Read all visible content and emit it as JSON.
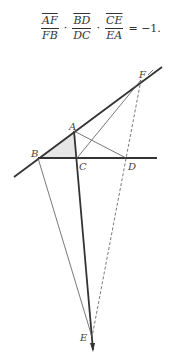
{
  "formula": {
    "fractions": [
      {
        "num": "AF",
        "den": "FB"
      },
      {
        "num": "BD",
        "den": "DC"
      },
      {
        "num": "CE",
        "den": "EA"
      }
    ],
    "operator": "·",
    "rhs": "= −1."
  },
  "figure": {
    "labels": {
      "A": "A",
      "B": "B",
      "C": "C",
      "D": "D",
      "E": "E",
      "F": "F"
    },
    "colors": {
      "line": "#333333",
      "shade": "#e6e6e6"
    }
  }
}
